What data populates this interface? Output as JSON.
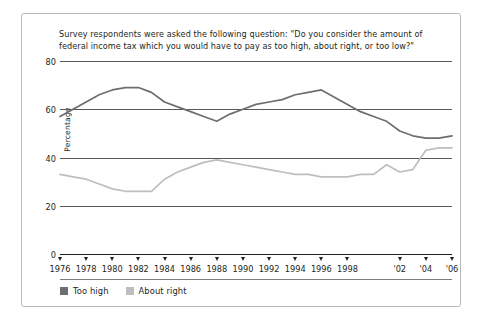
{
  "figure": {
    "question": "Survey respondents were asked the following question: \"Do you consider the amount of federal income tax which you would have to pay as too high, about right, or too low?\"",
    "yaxis_title": "Percentage",
    "legend": [
      {
        "label": "Too high",
        "color": "#6d6e71"
      },
      {
        "label": "About right",
        "color": "#bcbec0"
      }
    ]
  },
  "chart_data": {
    "type": "line",
    "title": "Survey respondents were asked the following question: \"Do you consider the amount of federal income tax which you would have to pay as too high, about right, or too low?\"",
    "xlabel": "",
    "ylabel": "Percentage",
    "ylim": [
      0,
      80
    ],
    "yticks": [
      0,
      20,
      40,
      60,
      80
    ],
    "grid": true,
    "legend_position": "bottom-left",
    "x": [
      1976,
      1977,
      1978,
      1979,
      1980,
      1981,
      1982,
      1983,
      1984,
      1985,
      1986,
      1987,
      1988,
      1989,
      1990,
      1991,
      1992,
      1993,
      1994,
      1995,
      1996,
      1997,
      1998,
      1999,
      2000,
      2001,
      2002,
      2003,
      2004,
      2005,
      2006
    ],
    "xtick_values": [
      1976,
      1978,
      1980,
      1982,
      1984,
      1986,
      1988,
      1990,
      1992,
      1994,
      1996,
      1998,
      2002,
      2004,
      2006
    ],
    "xtick_labels": [
      "1976",
      "1978",
      "1980",
      "1982",
      "1984",
      "1986",
      "1988",
      "1990",
      "1992",
      "1994",
      "1996",
      "1998",
      "'02",
      "'04",
      "'06"
    ],
    "series": [
      {
        "name": "Too high",
        "color": "#6d6e71",
        "values": [
          57,
          60,
          63,
          66,
          68,
          69,
          69,
          67,
          63,
          61,
          59,
          57,
          55,
          58,
          60,
          62,
          63,
          64,
          66,
          67,
          68,
          65,
          62,
          59,
          57,
          55,
          51,
          49,
          48,
          48,
          49
        ]
      },
      {
        "name": "About right",
        "color": "#bcbec0",
        "values": [
          33,
          32,
          31,
          29,
          27,
          26,
          26,
          26,
          31,
          34,
          36,
          38,
          39,
          38,
          37,
          36,
          35,
          34,
          33,
          33,
          32,
          32,
          32,
          33,
          33,
          37,
          34,
          35,
          43,
          44,
          44
        ]
      }
    ]
  }
}
